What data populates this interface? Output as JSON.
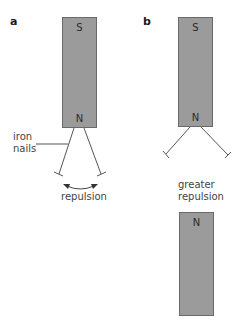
{
  "panels": {
    "a": {
      "label": "a",
      "magnet": {
        "top_pole": "S",
        "bottom_pole": "N"
      },
      "nails_label_line1": "iron",
      "nails_label_line2": "nails",
      "effect_label": "repulsion"
    },
    "b": {
      "label": "b",
      "magnet_top": {
        "top_pole": "S",
        "bottom_pole": "N"
      },
      "effect_label_line1": "greater",
      "effect_label_line2": "repulsion",
      "magnet_bottom": {
        "top_pole": "N"
      }
    }
  },
  "colors": {
    "magnet_fill": "#9b9b9b",
    "magnet_border": "#6a6a6a",
    "line": "#555555",
    "text": "#444444"
  }
}
